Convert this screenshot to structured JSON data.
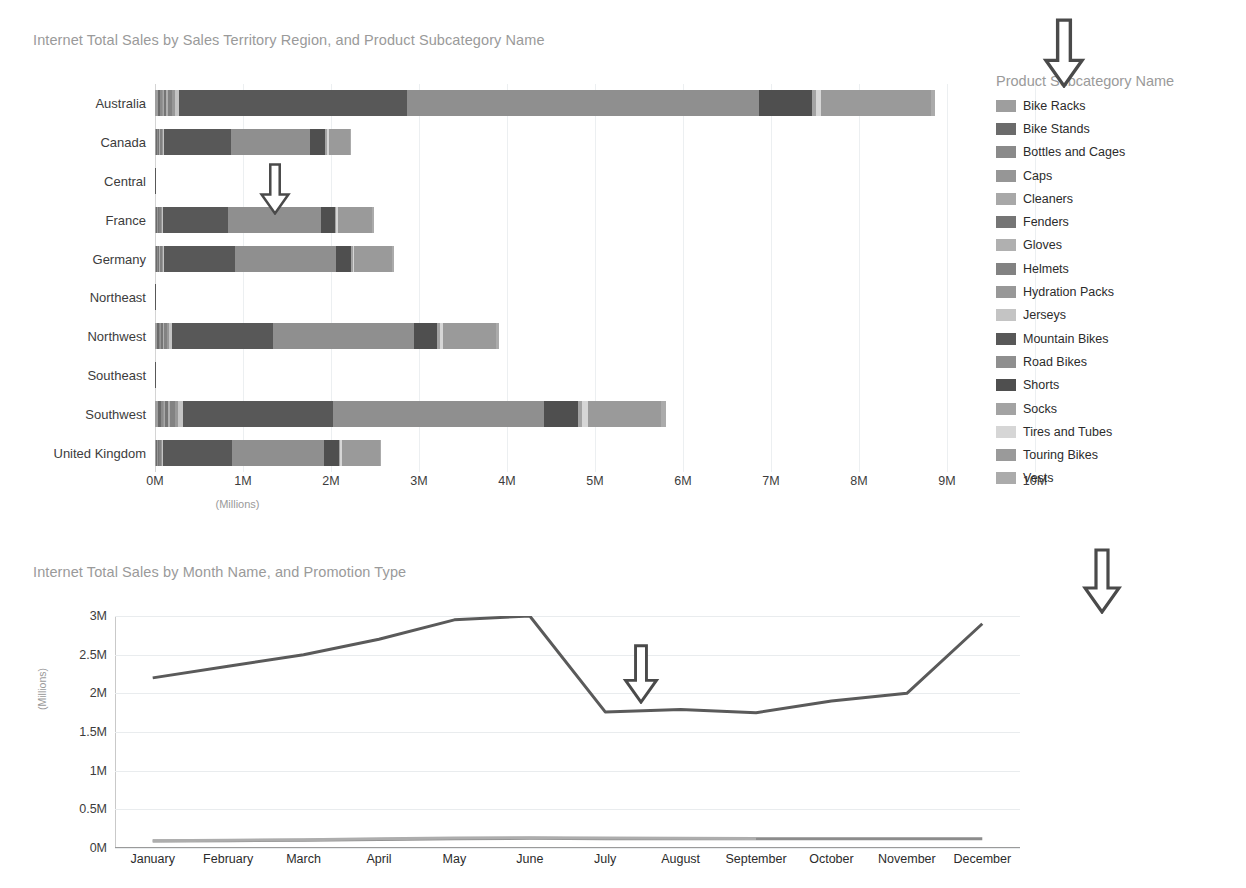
{
  "bar_chart": {
    "title": "Internet Total Sales by Sales Territory Region, and Product Subcategory Name",
    "x_unit": "(Millions)",
    "legend_title": "Product Subcategory Name"
  },
  "line_chart": {
    "title": "Internet Total Sales by Month Name, and Promotion Type",
    "y_unit": "(Millions)",
    "legend_title": "Promotion Type"
  },
  "chart_data": [
    {
      "type": "bar",
      "orientation": "horizontal",
      "stacked": true,
      "title": "Internet Total Sales by Sales Territory Region, and Product Subcategory Name",
      "xlabel": "(Millions)",
      "ylabel": "",
      "xlim": [
        0,
        10000000
      ],
      "xticks": [
        "0M",
        "1M",
        "2M",
        "3M",
        "4M",
        "5M",
        "6M",
        "7M",
        "8M",
        "9M",
        "10M"
      ],
      "grid": true,
      "legend_position": "right",
      "legend_title": "Product Subcategory Name",
      "categories": [
        "Australia",
        "Canada",
        "Central",
        "France",
        "Germany",
        "Northeast",
        "Northwest",
        "Southeast",
        "Southwest",
        "United Kingdom"
      ],
      "series": [
        {
          "name": "Bike Racks",
          "color": "#9e9e9e",
          "values": [
            30000,
            12000,
            0,
            11000,
            12000,
            0,
            22000,
            0,
            36000,
            11000
          ]
        },
        {
          "name": "Bike Stands",
          "color": "#6b6b6b",
          "values": [
            26000,
            10000,
            0,
            9000,
            10000,
            0,
            19000,
            0,
            31000,
            9000
          ]
        },
        {
          "name": "Bottles and Cages",
          "color": "#8a8a8a",
          "values": [
            18000,
            7000,
            0,
            6000,
            7000,
            0,
            13000,
            0,
            21000,
            6000
          ]
        },
        {
          "name": "Caps",
          "color": "#969696",
          "values": [
            15000,
            6000,
            0,
            5000,
            6000,
            0,
            11000,
            0,
            18000,
            5000
          ]
        },
        {
          "name": "Cleaners",
          "color": "#a8a8a8",
          "values": [
            9000,
            4000,
            0,
            3000,
            4000,
            0,
            7000,
            0,
            11000,
            3000
          ]
        },
        {
          "name": "Fenders",
          "color": "#757575",
          "values": [
            24000,
            9000,
            0,
            8000,
            9000,
            0,
            17000,
            0,
            28000,
            8000
          ]
        },
        {
          "name": "Gloves",
          "color": "#b0b0b0",
          "values": [
            21000,
            8000,
            0,
            7000,
            8000,
            0,
            15000,
            0,
            25000,
            7000
          ]
        },
        {
          "name": "Helmets",
          "color": "#828282",
          "values": [
            52000,
            20000,
            0,
            18000,
            20000,
            0,
            38000,
            0,
            62000,
            18000
          ]
        },
        {
          "name": "Hydration Packs",
          "color": "#989898",
          "values": [
            28000,
            11000,
            0,
            10000,
            11000,
            0,
            20000,
            0,
            33000,
            10000
          ]
        },
        {
          "name": "Jerseys",
          "color": "#c4c4c4",
          "values": [
            46000,
            18000,
            0,
            16000,
            18000,
            0,
            34000,
            0,
            55000,
            16000
          ]
        },
        {
          "name": "Mountain Bikes",
          "color": "#585858",
          "values": [
            2600000,
            760000,
            2000,
            740000,
            800000,
            2000,
            1150000,
            2000,
            1700000,
            780000
          ]
        },
        {
          "name": "Road Bikes",
          "color": "#8f8f8f",
          "values": [
            4000000,
            900000,
            0,
            1050000,
            1150000,
            0,
            1600000,
            0,
            2400000,
            1050000
          ]
        },
        {
          "name": "Shorts",
          "color": "#4f4f4f",
          "values": [
            600000,
            170000,
            0,
            160000,
            175000,
            0,
            260000,
            0,
            390000,
            170000
          ]
        },
        {
          "name": "Socks",
          "color": "#a3a3a3",
          "values": [
            40000,
            15000,
            0,
            14000,
            15000,
            0,
            28000,
            0,
            46000,
            14000
          ]
        },
        {
          "name": "Tires and Tubes",
          "color": "#d6d6d6",
          "values": [
            60000,
            22000,
            0,
            20000,
            22000,
            0,
            42000,
            0,
            68000,
            20000
          ]
        },
        {
          "name": "Touring Bikes",
          "color": "#9a9a9a",
          "values": [
            1250000,
            240000,
            0,
            390000,
            430000,
            0,
            600000,
            0,
            830000,
            430000
          ]
        },
        {
          "name": "Vests",
          "color": "#ababab",
          "values": [
            45000,
            18000,
            0,
            16000,
            18000,
            0,
            33000,
            0,
            53000,
            16000
          ]
        }
      ],
      "totals": [
        "9.0M",
        "2.0M",
        "0.0M",
        "2.6M",
        "2.8M",
        "0.0M",
        "3.9M",
        "0.0M",
        "5.8M",
        "2.6M"
      ]
    },
    {
      "type": "line",
      "title": "Internet Total Sales by Month Name, and Promotion Type",
      "xlabel": "",
      "ylabel": "(Millions)",
      "ylim": [
        0,
        3000000
      ],
      "yticks": [
        "0M",
        "0.5M",
        "1M",
        "1.5M",
        "2M",
        "2.5M",
        "3M"
      ],
      "grid": true,
      "legend_position": "right",
      "legend_title": "Promotion Type",
      "categories": [
        "January",
        "February",
        "March",
        "April",
        "May",
        "June",
        "July",
        "August",
        "September",
        "October",
        "November",
        "December"
      ],
      "series": [
        {
          "name": "New Product",
          "color": "#8c8c8c",
          "values": [
            90000,
            95000,
            100000,
            110000,
            120000,
            125000,
            120000,
            120000,
            118000,
            118000,
            118000,
            118000
          ]
        },
        {
          "name": "No Discount",
          "color": "#5a5a5a",
          "values": [
            2200000,
            2350000,
            2500000,
            2700000,
            2950000,
            3000000,
            1760000,
            1790000,
            1750000,
            1900000,
            2000000,
            2900000
          ]
        },
        {
          "name": "Volume Discount",
          "color": "#adadad",
          "values": [
            95000,
            100000,
            108000,
            118000,
            128000,
            133000,
            128000,
            126000,
            124000,
            0,
            0,
            0
          ]
        }
      ]
    }
  ],
  "annotations": {
    "arrows": [
      {
        "name": "arrow-product-subcategory-legend",
        "x": 1042,
        "y": 18,
        "w": 44,
        "h": 70
      },
      {
        "name": "arrow-bar-central-row",
        "x": 255,
        "y": 163,
        "w": 40,
        "h": 52
      },
      {
        "name": "arrow-promotion-type-legend",
        "x": 1082,
        "y": 548,
        "w": 40,
        "h": 66
      },
      {
        "name": "arrow-line-july-dip",
        "x": 620,
        "y": 644,
        "w": 42,
        "h": 60
      }
    ]
  }
}
